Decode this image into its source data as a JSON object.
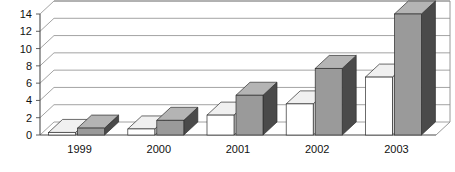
{
  "chart_data": {
    "type": "bar",
    "title": "",
    "subtitle": "",
    "xlabel": "",
    "ylabel": "",
    "categories": [
      "1999",
      "2000",
      "2001",
      "2002",
      "2003"
    ],
    "series": [
      {
        "name": "series-1",
        "color": "#ffffff",
        "values": [
          0.3,
          0.7,
          2.3,
          3.6,
          6.7
        ]
      },
      {
        "name": "series-2",
        "color": "#9a9a9a",
        "values": [
          0.8,
          1.7,
          4.6,
          7.7,
          14.0
        ]
      }
    ],
    "yticks": [
      0,
      2,
      4,
      6,
      8,
      10,
      12,
      14
    ],
    "ytick_labels": [
      "0",
      "2",
      "4",
      "6",
      "8",
      "10",
      "12",
      "14"
    ],
    "ylim": [
      0,
      14
    ],
    "grid": true,
    "grid_axis": "y",
    "legend": "none",
    "style": "3d-clustered-column",
    "colors": {
      "series1_front": "#ffffff",
      "series1_top": "#f0f0f0",
      "series1_side": "#d8d8d8",
      "series2_front": "#9a9a9a",
      "series2_top": "#b4b4b4",
      "series2_side": "#4a4a4a",
      "grid": "#8c8c8c",
      "axis": "#4d4d4d",
      "wall": "#ffffff",
      "floor": "#ffffff",
      "text": "#111111"
    }
  }
}
